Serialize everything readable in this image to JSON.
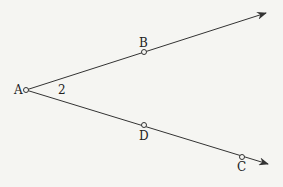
{
  "diagram": {
    "type": "geometry-angle",
    "vertex": {
      "label": "A",
      "x": 26,
      "y": 90
    },
    "angle_label": "2",
    "rays": [
      {
        "name": "upper",
        "through": "B",
        "end": [
          266,
          13
        ]
      },
      {
        "name": "lower",
        "through": [
          "D",
          "C"
        ],
        "end": [
          268,
          164
        ]
      }
    ],
    "points": [
      {
        "label": "A",
        "x": 26,
        "y": 90
      },
      {
        "label": "B",
        "x": 144,
        "y": 52
      },
      {
        "label": "D",
        "x": 144,
        "y": 125
      },
      {
        "label": "C",
        "x": 242,
        "y": 157
      }
    ],
    "colors": {
      "line": "#333333",
      "background": "#f5f5f2"
    }
  },
  "labels": {
    "A": "A",
    "B": "B",
    "D": "D",
    "C": "C",
    "angle": "2"
  }
}
